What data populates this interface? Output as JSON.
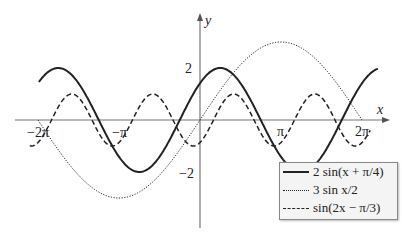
{
  "chart_data": {
    "type": "line",
    "title": "",
    "xlabel": "x",
    "ylabel": "y",
    "xlim": [
      -6.6,
      7.4
    ],
    "ylim": [
      -4.0,
      4.1
    ],
    "x_ticks": [
      "-2π",
      "-π",
      "π",
      "2π"
    ],
    "y_ticks": [
      "2",
      "-2"
    ],
    "grid": false,
    "legend_position": "lower right",
    "series": [
      {
        "name": "2 sin(x + π/4)",
        "style": "solid",
        "formula": "2*sin(x+pi/4)",
        "x_range": [
          -6.25,
          6.9
        ]
      },
      {
        "name": "3 sin x/2",
        "style": "dotted",
        "formula": "3*sin(x/2)",
        "x_range": [
          -6.28,
          6.28
        ]
      },
      {
        "name": "sin(2x − π/3)",
        "style": "dashed",
        "formula": "sin(2*x-pi/3)",
        "x_range": [
          -6.6,
          6.6
        ]
      }
    ]
  },
  "labels": {
    "x_axis": "x",
    "y_axis": "y",
    "tick_neg2pi": "−2π",
    "tick_negpi": "−π",
    "tick_pi": "π",
    "tick_2pi": "2π",
    "tick_2": "2",
    "tick_neg2": "−2"
  },
  "legend": [
    {
      "label": "2 sin(x + π/4)"
    },
    {
      "label": "3 sin x/2"
    },
    {
      "label": "sin(2x − π/3)"
    }
  ]
}
